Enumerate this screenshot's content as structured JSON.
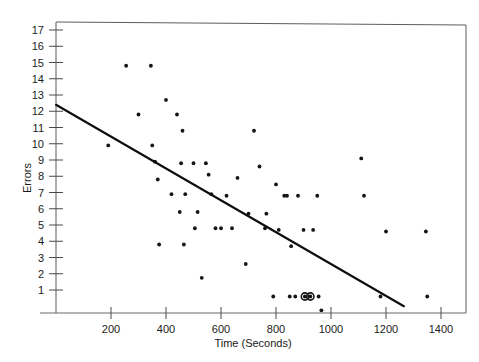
{
  "chart_data": {
    "type": "scatter",
    "title": "",
    "xlabel": "Time (Seconds)",
    "ylabel": "Errors",
    "xlim": [
      0,
      1520
    ],
    "ylim": [
      0,
      17.8
    ],
    "grid": false,
    "legend": null,
    "xticks": [
      200,
      400,
      600,
      800,
      1000,
      1200,
      1400
    ],
    "xtick_labels": [
      "200",
      "400",
      "600",
      "800",
      "1000",
      "1200",
      "1400"
    ],
    "yticks": [
      1,
      2,
      3,
      4,
      5,
      6,
      7,
      8,
      9,
      10,
      11,
      12,
      13,
      14,
      15,
      16,
      17
    ],
    "ytick_labels": [
      "1",
      "2",
      "3",
      "4",
      "5",
      "6",
      "7",
      "8",
      "9",
      "10",
      "11",
      "12",
      "13",
      "14",
      "15",
      "16",
      "17"
    ],
    "points": [
      {
        "x": 190,
        "y": 9.9
      },
      {
        "x": 255,
        "y": 14.8
      },
      {
        "x": 300,
        "y": 11.8
      },
      {
        "x": 345,
        "y": 14.8
      },
      {
        "x": 350,
        "y": 9.9
      },
      {
        "x": 360,
        "y": 8.9
      },
      {
        "x": 370,
        "y": 7.8
      },
      {
        "x": 375,
        "y": 3.8
      },
      {
        "x": 400,
        "y": 12.7
      },
      {
        "x": 420,
        "y": 6.9
      },
      {
        "x": 440,
        "y": 11.8
      },
      {
        "x": 450,
        "y": 5.8
      },
      {
        "x": 455,
        "y": 8.8
      },
      {
        "x": 460,
        "y": 10.8
      },
      {
        "x": 465,
        "y": 3.8
      },
      {
        "x": 470,
        "y": 6.9
      },
      {
        "x": 500,
        "y": 8.8
      },
      {
        "x": 505,
        "y": 4.8
      },
      {
        "x": 515,
        "y": 5.8
      },
      {
        "x": 530,
        "y": 1.75
      },
      {
        "x": 545,
        "y": 8.8
      },
      {
        "x": 555,
        "y": 8.1
      },
      {
        "x": 565,
        "y": 6.9
      },
      {
        "x": 580,
        "y": 4.8
      },
      {
        "x": 600,
        "y": 4.8
      },
      {
        "x": 620,
        "y": 6.8
      },
      {
        "x": 640,
        "y": 4.8
      },
      {
        "x": 660,
        "y": 7.9
      },
      {
        "x": 690,
        "y": 2.6
      },
      {
        "x": 700,
        "y": 5.7
      },
      {
        "x": 720,
        "y": 10.8
      },
      {
        "x": 740,
        "y": 8.6
      },
      {
        "x": 760,
        "y": 4.8
      },
      {
        "x": 765,
        "y": 5.7
      },
      {
        "x": 790,
        "y": 0.6
      },
      {
        "x": 800,
        "y": 7.5
      },
      {
        "x": 810,
        "y": 4.7
      },
      {
        "x": 830,
        "y": 6.8
      },
      {
        "x": 840,
        "y": 6.8
      },
      {
        "x": 850,
        "y": 0.6
      },
      {
        "x": 855,
        "y": 3.7
      },
      {
        "x": 870,
        "y": 0.6
      },
      {
        "x": 880,
        "y": 6.8
      },
      {
        "x": 900,
        "y": 4.7
      },
      {
        "x": 905,
        "y": 0.6
      },
      {
        "x": 925,
        "y": 0.6
      },
      {
        "x": 935,
        "y": 4.7
      },
      {
        "x": 950,
        "y": 6.8
      },
      {
        "x": 955,
        "y": 0.6
      },
      {
        "x": 965,
        "y": -0.25
      },
      {
        "x": 1110,
        "y": 9.1
      },
      {
        "x": 1120,
        "y": 6.8
      },
      {
        "x": 1180,
        "y": 0.6
      },
      {
        "x": 1200,
        "y": 4.6
      },
      {
        "x": 1345,
        "y": 4.6
      },
      {
        "x": 1350,
        "y": 0.6
      }
    ],
    "highlighted_points": [
      {
        "x": 905,
        "y": 0.6
      },
      {
        "x": 925,
        "y": 0.6
      }
    ],
    "fit_line": {
      "x_start": 0,
      "y_start": 12.4,
      "x_end": 1265,
      "y_end": 0
    }
  }
}
